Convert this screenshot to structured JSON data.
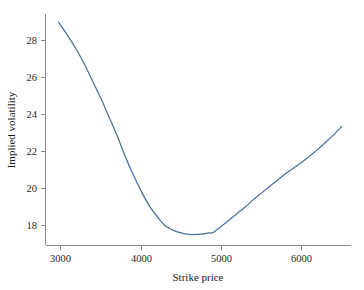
{
  "chart_data": {
    "type": "line",
    "title": "",
    "xlabel": "Strike price",
    "ylabel": "Implied volatility",
    "xlim": [
      2880,
      6640
    ],
    "ylim": [
      17.1,
      29.3
    ],
    "xticks": [
      3000,
      4000,
      5000,
      6000
    ],
    "xtick_labels": [
      "3000",
      "4000",
      "5000",
      "6000"
    ],
    "yticks": [
      18,
      20,
      22,
      24,
      26,
      28
    ],
    "ytick_labels": [
      "18",
      "20",
      "22",
      "24",
      "26",
      "28"
    ],
    "grid": false,
    "legend": false,
    "series": [
      {
        "name": "Implied volatility smile",
        "color": "#4a6f9c",
        "x": [
          2975,
          3100,
          3200,
          3300,
          3400,
          3500,
          3600,
          3700,
          3800,
          3900,
          4000,
          4100,
          4200,
          4300,
          4400,
          4500,
          4600,
          4700,
          4800,
          4850,
          4900,
          5000,
          5100,
          5200,
          5300,
          5400,
          5500,
          5600,
          5700,
          5800,
          5900,
          6000,
          6100,
          6200,
          6300,
          6400,
          6500
        ],
        "y": [
          29.0,
          28.2,
          27.5,
          26.7,
          25.8,
          24.9,
          23.9,
          22.9,
          21.8,
          20.8,
          19.9,
          19.1,
          18.5,
          18.0,
          17.75,
          17.6,
          17.52,
          17.52,
          17.56,
          17.6,
          17.62,
          17.95,
          18.3,
          18.65,
          19.0,
          19.4,
          19.75,
          20.1,
          20.45,
          20.8,
          21.1,
          21.4,
          21.75,
          22.1,
          22.5,
          22.9,
          23.35
        ]
      }
    ]
  },
  "axes": {
    "x_axis_label": "Strike price",
    "y_axis_label": "Implied volatility"
  },
  "colors": {
    "curve": "#4a6f9c",
    "axis": "#8a8a8a",
    "text": "#1a1a1a",
    "background": "#ffffff"
  }
}
